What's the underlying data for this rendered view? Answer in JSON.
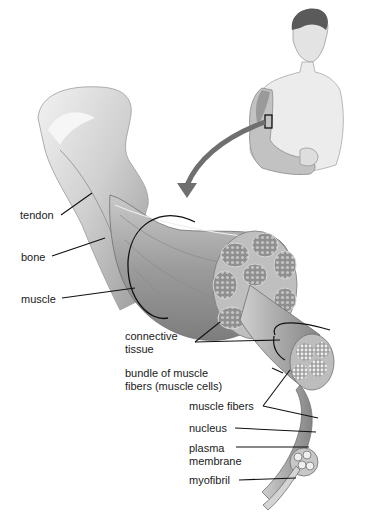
{
  "diagram": {
    "labels": {
      "tendon": "tendon",
      "bone": "bone",
      "muscle": "muscle",
      "connective_tissue_1": "connective",
      "connective_tissue_2": "tissue",
      "bundle_1": "bundle of muscle",
      "bundle_2": "fibers (muscle cells)",
      "muscle_fibers": "muscle fibers",
      "nucleus": "nucleus",
      "plasma_membrane_1": "plasma",
      "plasma_membrane_2": "membrane",
      "myofibril": "myofibril"
    },
    "colors": {
      "background": "#ffffff",
      "line": "#111111",
      "tissue_light": "#e6e6e6",
      "tissue_mid": "#b5b5b5",
      "tissue_dark": "#7a7a7a"
    }
  }
}
